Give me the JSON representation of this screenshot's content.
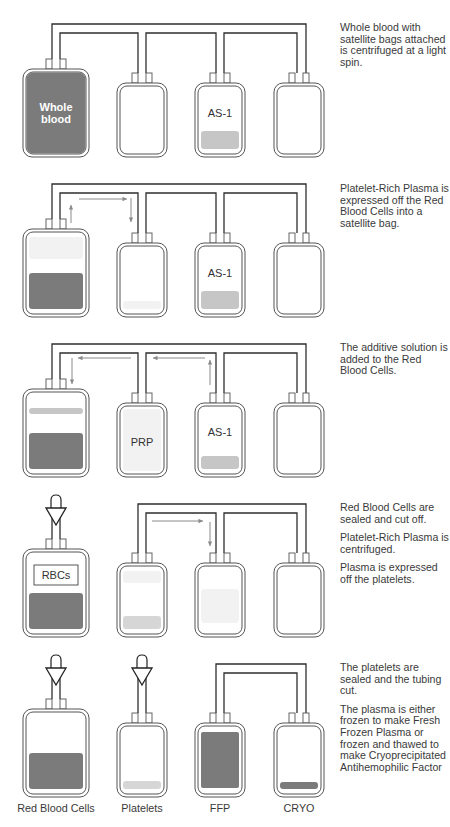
{
  "colors": {
    "outline": "#555555",
    "tube": "#2e2e2e",
    "arrow": "#8a8a8a",
    "dark_fill": "#7b7b7b",
    "light_fill": "#c6c6c6",
    "pale_fill": "#d6d6d6",
    "prp_fill": "#f2f2f2",
    "label_dark": "#333333",
    "label_white": "#ffffff"
  },
  "panels": [
    {
      "id": "step-1",
      "caption": [
        "Whole blood with satellite bags attached is centrifuged at a light spin."
      ],
      "caption_top": 22,
      "bags": [
        {
          "x": 23,
          "y": 69,
          "w": 66,
          "h": 88,
          "ports": [
            46,
            60
          ],
          "fill": {
            "type": "full",
            "color": "dark_fill"
          },
          "label": "Whole\nblood",
          "label_color": "label_white"
        },
        {
          "x": 117,
          "y": 83,
          "w": 50,
          "h": 74,
          "ports": [
            132,
            146
          ],
          "fill": null,
          "label": ""
        },
        {
          "x": 195,
          "y": 83,
          "w": 50,
          "h": 74,
          "ports": [
            210,
            224
          ],
          "fill": {
            "type": "bottom",
            "color": "light_fill",
            "h": 18
          },
          "label": "AS-1",
          "label_color": "label_dark"
        },
        {
          "x": 274,
          "y": 83,
          "w": 50,
          "h": 74,
          "ports": [
            289,
            303
          ],
          "fill": null,
          "label": ""
        }
      ],
      "tube_top": 24
    },
    {
      "id": "step-2",
      "caption": [
        "Platelet-Rich Plasma is expressed off the Red Blood Cells into a satellite bag."
      ],
      "caption_top": 183
    },
    {
      "id": "step-3",
      "caption": [
        "The additive solution is added to the Red Blood Cells."
      ],
      "caption_top": 342
    },
    {
      "id": "step-4",
      "caption": [
        "Red Blood Cells are sealed and cut off.",
        "Platelet-Rich Plasma is centrifuged.",
        "Plasma is expressed off the platelets."
      ],
      "caption_top": 502
    },
    {
      "id": "step-5",
      "caption": [
        "The platelets are sealed and the tubing cut.",
        "The plasma is either frozen to make Fresh Frozen Plasma or frozen and thawed to make Cryoprecipitated Antihemophilic Factor"
      ],
      "caption_top": 662
    }
  ],
  "bag_labels": {
    "whole_blood": "Whole\nblood",
    "as1": "AS-1",
    "prp": "PRP",
    "rbcs": "RBCs"
  },
  "bottom_labels": [
    {
      "text": "Red Blood Cells",
      "cx": 56
    },
    {
      "text": "Platelets",
      "cx": 142
    },
    {
      "text": "FFP",
      "cx": 220
    },
    {
      "text": "CRYO",
      "cx": 299
    }
  ]
}
